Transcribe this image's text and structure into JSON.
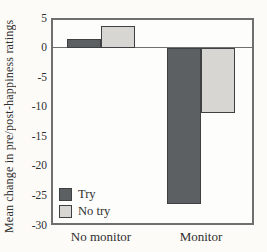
{
  "figure": {
    "background_color": "#fcfbf8",
    "frame_color": "#6f6f6f",
    "bar_border_color": "#3e4042",
    "text_color": "#2f2f2f"
  },
  "chart_data": {
    "type": "bar",
    "title": "",
    "xlabel": "",
    "ylabel": "Mean change in pre/post-happiness ratings",
    "categories": [
      "No monitor",
      "Monitor"
    ],
    "series": [
      {
        "name": "Try",
        "color": "#5c6063",
        "values": [
          1.5,
          -26.5
        ]
      },
      {
        "name": "No try",
        "color": "#d7d6d2",
        "values": [
          3.7,
          -11
        ]
      }
    ],
    "ylim": [
      -30,
      5
    ],
    "yticks": [
      5,
      0,
      -5,
      -10,
      -15,
      -20,
      -25,
      -30
    ],
    "grid": false,
    "zero_line": true,
    "legend_position": "inside-lower-left"
  }
}
